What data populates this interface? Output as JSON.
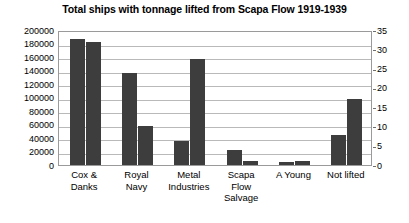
{
  "chart_data": {
    "type": "bar",
    "title": "Total ships with tonnage lifted from Scapa Flow 1919-1939",
    "xlabel": "",
    "ylabel": "",
    "grid": true,
    "legend": "none",
    "categories": [
      "Cox &\nDanks",
      "Royal\nNavy",
      "Metal\nIndustries",
      "Scapa\nFlow\nSalvage",
      "A Young",
      "Not lifted"
    ],
    "series": [
      {
        "name": "Tonnage lifted",
        "axis": "left",
        "values": [
          186000,
          136000,
          35000,
          22000,
          5000,
          45000
        ]
      },
      {
        "name": "Number of ships",
        "axis": "right",
        "values": [
          32,
          10,
          27.5,
          1,
          1,
          17
        ]
      }
    ],
    "y_left": {
      "min": 0,
      "max": 200000,
      "step": 20000,
      "ticks": [
        "0",
        "20000",
        "40000",
        "60000",
        "80000",
        "100000",
        "120000",
        "140000",
        "160000",
        "180000",
        "200000"
      ]
    },
    "y_right": {
      "min": 0,
      "max": 35,
      "step": 5,
      "ticks": [
        "0",
        "5",
        "10",
        "15",
        "20",
        "25",
        "30",
        "35"
      ]
    }
  }
}
